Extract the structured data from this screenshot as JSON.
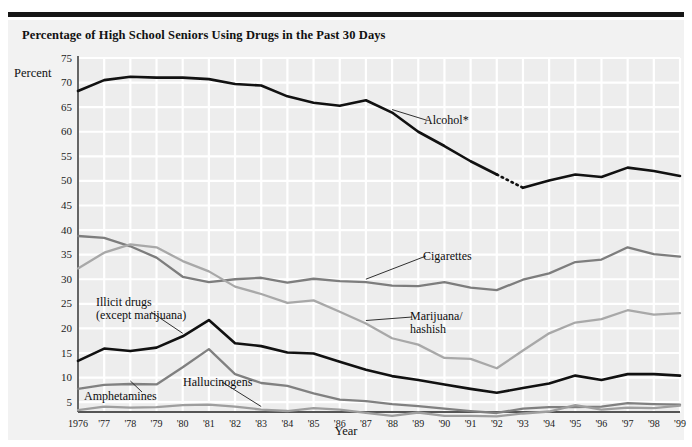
{
  "title": "Percentage of High School Seniors Using Drugs in the Past 30 Days",
  "axes": {
    "ylabel": "Percent",
    "xlabel": "Year",
    "yticks": [
      "75",
      "70",
      "65",
      "60",
      "55",
      "50",
      "45",
      "40",
      "35",
      "30",
      "25",
      "20",
      "15",
      "10",
      "5"
    ],
    "xticks": [
      "1976",
      "'77",
      "'78",
      "'79",
      "'80",
      "'81",
      "'82",
      "'83",
      "'84",
      "'85",
      "'86",
      "'87",
      "'88",
      "'89",
      "'90",
      "'91",
      "'92",
      "'93",
      "'94",
      "'95",
      "'96",
      "'97",
      "'98",
      "'99"
    ]
  },
  "annotations": {
    "alcohol": "Alcohol*",
    "cigarettes": "Cigarettes",
    "marijuana": "Marijuana/\nhashish",
    "illicit": "Illicit drugs\n(except marijuana)",
    "amphetamines": "Amphetamines",
    "hallucinogens": "Hallucinogens"
  },
  "colors": {
    "alcohol": "#111111",
    "illicit": "#111111",
    "cigarettes": "#7d7d7d",
    "marijuana": "#a8a8a8",
    "amphetamines": "#808080",
    "hallucinogens": "#9e9e9e",
    "plot_background": "#ededed",
    "gridline": "#ffffff",
    "axis": "#555555",
    "page_background": "#f2f2f2"
  },
  "chart_data": {
    "type": "line",
    "title": "Percentage of High School Seniors Using Drugs in the Past 30 Days",
    "xlabel": "Year",
    "ylabel": "Percent",
    "ylim": [
      3,
      75
    ],
    "xlim": [
      1976,
      1999
    ],
    "grid": true,
    "legend": "inline-annotations",
    "x": [
      1976,
      1977,
      1978,
      1979,
      1980,
      1981,
      1982,
      1983,
      1984,
      1985,
      1986,
      1987,
      1988,
      1989,
      1990,
      1991,
      1992,
      1993,
      1994,
      1995,
      1996,
      1997,
      1998,
      1999
    ],
    "series": [
      {
        "name": "Alcohol*",
        "color": "#111111",
        "note": "dotted segment between 1992 and 1993 indicates a change in survey question wording",
        "dashed_between": [
          1992,
          1993
        ],
        "values": [
          68.3,
          70.5,
          71.2,
          71.0,
          71.0,
          70.7,
          69.7,
          69.4,
          67.2,
          65.9,
          65.3,
          66.4,
          63.9,
          60.0,
          57.1,
          54.0,
          51.3,
          48.6,
          50.1,
          51.3,
          50.8,
          52.7,
          52.0,
          51.0
        ]
      },
      {
        "name": "Cigarettes",
        "color": "#7d7d7d",
        "values": [
          38.8,
          38.4,
          36.7,
          34.4,
          30.5,
          29.4,
          30.0,
          30.3,
          29.3,
          30.1,
          29.6,
          29.4,
          28.7,
          28.6,
          29.4,
          28.3,
          27.8,
          29.9,
          31.2,
          33.5,
          34.0,
          36.5,
          35.1,
          34.6
        ]
      },
      {
        "name": "Marijuana/hashish",
        "color": "#a8a8a8",
        "values": [
          32.2,
          35.4,
          37.1,
          36.5,
          33.7,
          31.6,
          28.5,
          27.0,
          25.2,
          25.7,
          23.4,
          21.0,
          18.0,
          16.7,
          14.0,
          13.8,
          11.9,
          15.5,
          19.0,
          21.2,
          21.9,
          23.7,
          22.8,
          23.1
        ]
      },
      {
        "name": "Illicit drugs (except marijuana)",
        "color": "#111111",
        "values": [
          13.4,
          15.9,
          15.4,
          16.1,
          18.4,
          21.7,
          17.0,
          16.4,
          15.1,
          14.9,
          13.2,
          11.6,
          10.3,
          9.5,
          8.6,
          7.7,
          6.9,
          7.9,
          8.8,
          10.4,
          9.5,
          10.7,
          10.7,
          10.4
        ]
      },
      {
        "name": "Amphetamines",
        "color": "#808080",
        "values": [
          7.7,
          8.5,
          8.7,
          8.6,
          12.1,
          15.8,
          10.7,
          8.9,
          8.3,
          6.8,
          5.5,
          5.2,
          4.6,
          4.2,
          3.7,
          3.2,
          2.8,
          3.7,
          4.0,
          4.0,
          4.1,
          4.8,
          4.6,
          4.5
        ]
      },
      {
        "name": "Hallucinogens",
        "color": "#9e9e9e",
        "values": [
          3.4,
          4.1,
          3.9,
          4.0,
          4.4,
          4.5,
          4.1,
          3.5,
          3.2,
          3.8,
          3.5,
          2.8,
          2.2,
          2.9,
          2.2,
          2.2,
          2.1,
          2.7,
          3.1,
          4.4,
          3.5,
          3.9,
          3.8,
          4.3
        ]
      }
    ]
  }
}
